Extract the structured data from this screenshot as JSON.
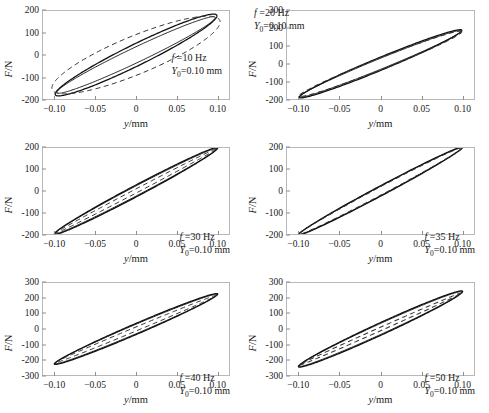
{
  "figure": {
    "axis_labels": {
      "x": "y/mm",
      "y": "F/N"
    },
    "x_unit": "mm",
    "y_unit": "N"
  },
  "chart_data": [
    {
      "type": "line",
      "title": "",
      "xlabel": "y/mm",
      "ylabel": "F/N",
      "xlim": [
        -0.115,
        0.115
      ],
      "ylim": [
        -200,
        200
      ],
      "xticks": [
        -0.1,
        -0.05,
        0,
        0.05,
        0.1
      ],
      "xticklabels": [
        "-0.10",
        "-0.05",
        "0",
        "0.05",
        "0.10"
      ],
      "yticks": [
        -200,
        -100,
        0,
        100,
        200
      ],
      "yticklabels": [
        "-200",
        "-100",
        "0",
        "100",
        "200"
      ],
      "grid": false,
      "legend": "none",
      "annotation": {
        "frequency_label": "f =10 Hz",
        "amplitude_label": "Y",
        "amplitude_sub": "0",
        "amplitude_value": "=0.10 mm",
        "frequency_hz": 10,
        "amplitude_mm": 0.1
      },
      "annotation_pos": "mid-right",
      "series": [
        {
          "name": "experiment-1",
          "style": "solid",
          "tilt_deg": 58,
          "semi_x": 0.1,
          "semi_y": 178,
          "phase_open": 0.3
        },
        {
          "name": "experiment-2",
          "style": "solid",
          "tilt_deg": 57,
          "semi_x": 0.098,
          "semi_y": 170,
          "phase_open": 0.22
        },
        {
          "name": "model",
          "style": "dashed",
          "tilt_deg": 47,
          "semi_x": 0.104,
          "semi_y": 150,
          "phase_open": 0.62
        }
      ]
    },
    {
      "type": "line",
      "title": "",
      "xlabel": "y/mm",
      "ylabel": "F/N",
      "xlim": [
        -0.115,
        0.115
      ],
      "ylim": [
        -200,
        300
      ],
      "xticks": [
        -0.1,
        -0.05,
        0,
        0.05,
        0.1
      ],
      "xticklabels": [
        "-0.10",
        "-0.05",
        "0",
        "0.05",
        "0.10"
      ],
      "yticks": [
        -200,
        -100,
        0,
        100,
        200,
        300
      ],
      "yticklabels": [
        "-200",
        "-100",
        "0",
        "100",
        "200",
        "300"
      ],
      "grid": false,
      "legend": "none",
      "annotation": {
        "frequency_label": "f =20 Hz",
        "amplitude_label": "Y",
        "amplitude_sub": "0",
        "amplitude_value": "=0.10 mm",
        "frequency_hz": 20,
        "amplitude_mm": 0.1
      },
      "annotation_pos": "top-left",
      "series": [
        {
          "name": "experiment-1",
          "style": "solid",
          "tilt_deg": 60,
          "semi_x": 0.1,
          "semi_y": 190,
          "phase_open": 0.2
        },
        {
          "name": "experiment-2",
          "style": "solid",
          "tilt_deg": 60,
          "semi_x": 0.099,
          "semi_y": 186,
          "phase_open": 0.17
        },
        {
          "name": "model",
          "style": "dashed",
          "tilt_deg": 59,
          "semi_x": 0.1,
          "semi_y": 182,
          "phase_open": 0.19
        }
      ]
    },
    {
      "type": "line",
      "title": "",
      "xlabel": "y/mm",
      "ylabel": "F/N",
      "xlim": [
        -0.115,
        0.115
      ],
      "ylim": [
        -200,
        200
      ],
      "xticks": [
        -0.1,
        -0.05,
        0,
        0.05,
        0.1
      ],
      "xticklabels": [
        "-0.10",
        "-0.05",
        "0",
        "0.05",
        "0.10"
      ],
      "yticks": [
        -200,
        -100,
        0,
        100,
        200
      ],
      "yticklabels": [
        "-200",
        "-100",
        "0",
        "100",
        "200"
      ],
      "grid": false,
      "legend": "none",
      "annotation": {
        "frequency_label": "f =30 Hz",
        "amplitude_label": "Y",
        "amplitude_sub": "0",
        "amplitude_value": "=0.10 mm",
        "frequency_hz": 30,
        "amplitude_mm": 0.1
      },
      "annotation_pos": "bottom-right",
      "series": [
        {
          "name": "experiment-1",
          "style": "solid",
          "tilt_deg": 67,
          "semi_x": 0.101,
          "semi_y": 200,
          "phase_open": 0.14
        },
        {
          "name": "experiment-2",
          "style": "solid",
          "tilt_deg": 67,
          "semi_x": 0.1,
          "semi_y": 197,
          "phase_open": 0.12
        },
        {
          "name": "model",
          "style": "dashed",
          "tilt_deg": 67,
          "semi_x": 0.099,
          "semi_y": 195,
          "phase_open": 0.05
        }
      ]
    },
    {
      "type": "line",
      "title": "",
      "xlabel": "y/mm",
      "ylabel": "F/N",
      "xlim": [
        -0.115,
        0.115
      ],
      "ylim": [
        -200,
        200
      ],
      "xticks": [
        -0.1,
        -0.05,
        0,
        0.05,
        0.1
      ],
      "xticklabels": [
        "-0.10",
        "-0.05",
        "0",
        "0.05",
        "0.10"
      ],
      "yticks": [
        -200,
        -100,
        0,
        100,
        200
      ],
      "yticklabels": [
        "-200",
        "-100",
        "0",
        "100",
        "200"
      ],
      "grid": false,
      "legend": "none",
      "annotation": {
        "frequency_label": "f =35 Hz",
        "amplitude_label": "Y",
        "amplitude_sub": "0",
        "amplitude_value": "=0.10 mm",
        "frequency_hz": 35,
        "amplitude_mm": 0.1
      },
      "annotation_pos": "bottom-right",
      "series": [
        {
          "name": "experiment-1",
          "style": "solid",
          "tilt_deg": 68,
          "semi_x": 0.101,
          "semi_y": 203,
          "phase_open": 0.12
        },
        {
          "name": "experiment-2",
          "style": "solid",
          "tilt_deg": 68,
          "semi_x": 0.1,
          "semi_y": 201,
          "phase_open": 0.11
        },
        {
          "name": "model",
          "style": "dashed",
          "tilt_deg": 68,
          "semi_x": 0.1,
          "semi_y": 200,
          "phase_open": 0.1
        }
      ]
    },
    {
      "type": "line",
      "title": "",
      "xlabel": "y/mm",
      "ylabel": "F/N",
      "xlim": [
        -0.115,
        0.115
      ],
      "ylim": [
        -300,
        300
      ],
      "xticks": [
        -0.1,
        -0.05,
        0,
        0.05,
        0.1
      ],
      "xticklabels": [
        "-0.10",
        "-0.05",
        "0",
        "0.05",
        "0.10"
      ],
      "yticks": [
        -300,
        -200,
        -100,
        0,
        100,
        200,
        300
      ],
      "yticklabels": [
        "-300",
        "-200",
        "-100",
        "0",
        "100",
        "200",
        "300"
      ],
      "grid": false,
      "legend": "none",
      "annotation": {
        "frequency_label": "f =40 Hz",
        "amplitude_label": "Y",
        "amplitude_sub": "0",
        "amplitude_value": "=0.10 mm",
        "frequency_hz": 40,
        "amplitude_mm": 0.1
      },
      "annotation_pos": "bottom-right",
      "series": [
        {
          "name": "experiment-1",
          "style": "solid",
          "tilt_deg": 65,
          "semi_x": 0.101,
          "semi_y": 228,
          "phase_open": 0.16
        },
        {
          "name": "experiment-2",
          "style": "solid",
          "tilt_deg": 65,
          "semi_x": 0.1,
          "semi_y": 224,
          "phase_open": 0.14
        },
        {
          "name": "model",
          "style": "dashed",
          "tilt_deg": 64,
          "semi_x": 0.1,
          "semi_y": 220,
          "phase_open": 0.06
        }
      ]
    },
    {
      "type": "line",
      "title": "",
      "xlabel": "y/mm",
      "ylabel": "F/N",
      "xlim": [
        -0.115,
        0.115
      ],
      "ylim": [
        -300,
        300
      ],
      "xticks": [
        -0.1,
        -0.05,
        0,
        0.05,
        0.1
      ],
      "xticklabels": [
        "-0.10",
        "-0.05",
        "0",
        "0.05",
        "0.10"
      ],
      "yticks": [
        -300,
        -200,
        -100,
        0,
        100,
        200,
        300
      ],
      "yticklabels": [
        "-300",
        "-200",
        "-100",
        "0",
        "100",
        "200",
        "300"
      ],
      "grid": false,
      "legend": "none",
      "annotation": {
        "frequency_label": "f =50 Hz",
        "amplitude_label": "Y",
        "amplitude_sub": "0",
        "amplitude_value": "=0.10 mm",
        "frequency_hz": 50,
        "amplitude_mm": 0.1
      },
      "annotation_pos": "bottom-right",
      "series": [
        {
          "name": "experiment-1",
          "style": "solid",
          "tilt_deg": 66,
          "semi_x": 0.101,
          "semi_y": 245,
          "phase_open": 0.17
        },
        {
          "name": "experiment-2",
          "style": "solid",
          "tilt_deg": 66,
          "semi_x": 0.1,
          "semi_y": 241,
          "phase_open": 0.15
        },
        {
          "name": "model",
          "style": "dashed",
          "tilt_deg": 65,
          "semi_x": 0.1,
          "semi_y": 236,
          "phase_open": 0.05
        }
      ]
    }
  ]
}
